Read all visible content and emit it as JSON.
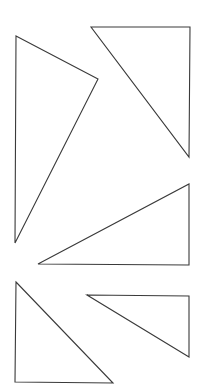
{
  "diagram": {
    "background": "#ffffff",
    "stroke_color": "#3a3a3a",
    "shapes": [
      {
        "id": "triangle-1",
        "type": "triangle",
        "points": "16,36 98,79 15,243"
      },
      {
        "id": "triangle-2",
        "type": "triangle",
        "points": "91,27 190,27 189,157"
      },
      {
        "id": "triangle-3",
        "type": "triangle",
        "points": "189,184 189,265 38,264"
      },
      {
        "id": "triangle-4",
        "type": "triangle",
        "points": "16,282 113,383 15,382"
      },
      {
        "id": "triangle-5",
        "type": "triangle",
        "points": "87,295 189,296 189,357"
      }
    ]
  }
}
